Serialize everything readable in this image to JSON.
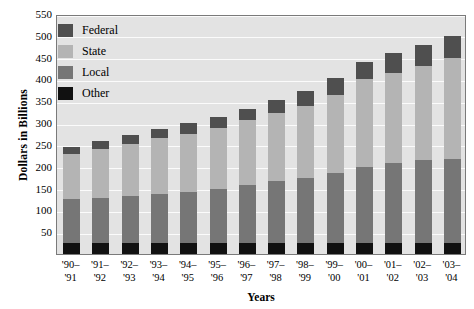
{
  "chart_data": {
    "type": "bar",
    "subtype": "stacked-bar",
    "title": "",
    "xlabel": "Years",
    "ylabel": "Dollars in Billions",
    "ylim": [
      0,
      550
    ],
    "yticks": [
      50,
      100,
      150,
      200,
      250,
      300,
      350,
      400,
      450,
      500,
      550
    ],
    "grid": true,
    "legend_position": "top-left",
    "categories": [
      "'90–'91",
      "'91–'92",
      "'92–'93",
      "'93–'94",
      "'94–'95",
      "'95–'96",
      "'96–'97",
      "'97–'98",
      "'98–'99",
      "'99–'00",
      "'00–'01",
      "'01–'02",
      "'02–'03",
      "'03–'04"
    ],
    "categories_lines": [
      [
        "'90–",
        "'91"
      ],
      [
        "'91–",
        "'92"
      ],
      [
        "'92–",
        "'93"
      ],
      [
        "'93–",
        "'94"
      ],
      [
        "'94–",
        "'95"
      ],
      [
        "'95–",
        "'96"
      ],
      [
        "'96–",
        "'97"
      ],
      [
        "'97–",
        "'98"
      ],
      [
        "'98–",
        "'99"
      ],
      [
        "'99–",
        "'00"
      ],
      [
        "'00–",
        "'01"
      ],
      [
        "'01–",
        "'02"
      ],
      [
        "'02–",
        "'03"
      ],
      [
        "'03–",
        "'04"
      ]
    ],
    "stack_order_bottom_to_top": [
      "Other",
      "Local",
      "State",
      "Federal"
    ],
    "series": [
      {
        "name": "Other",
        "color": "#111111",
        "values": [
          25,
          25,
          25,
          25,
          25,
          25,
          25,
          25,
          25,
          25,
          25,
          25,
          25,
          25
        ]
      },
      {
        "name": "Local",
        "color": "#767676",
        "values": [
          100,
          103,
          108,
          113,
          118,
          123,
          133,
          143,
          150,
          160,
          175,
          183,
          190,
          193
        ]
      },
      {
        "name": "State",
        "color": "#b4b4b4",
        "values": [
          105,
          112,
          120,
          127,
          133,
          140,
          148,
          155,
          165,
          180,
          200,
          207,
          217,
          232
        ]
      },
      {
        "name": "Federal",
        "color": "#4f4f4f",
        "values": [
          15,
          18,
          20,
          22,
          24,
          25,
          27,
          30,
          33,
          38,
          40,
          45,
          48,
          50
        ]
      }
    ],
    "totals": [
      245,
      258,
      273,
      287,
      300,
      313,
      333,
      353,
      373,
      403,
      440,
      460,
      480,
      500
    ]
  },
  "legend": {
    "items": [
      {
        "label": "Federal",
        "color": "#4f4f4f"
      },
      {
        "label": "State",
        "color": "#b4b4b4"
      },
      {
        "label": "Local",
        "color": "#767676"
      },
      {
        "label": "Other",
        "color": "#111111"
      }
    ]
  },
  "axes": {
    "y_title": "Dollars in Billions",
    "x_title": "Years"
  },
  "colors": {
    "plot_background": "#e3e3e3",
    "gridline": "#fbfbfb",
    "plot_border": "#7a7a7a",
    "page_background": "#ffffff"
  }
}
